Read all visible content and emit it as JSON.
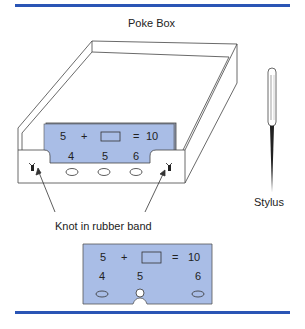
{
  "title": "Poke Box",
  "labels": {
    "stylus": "Stylus",
    "knot": "Knot in rubber band"
  },
  "box_card": {
    "equation": {
      "left": "5",
      "op": "+",
      "eq": "=",
      "result": "10"
    },
    "choices": [
      "4",
      "5",
      "6"
    ]
  },
  "detail_card": {
    "equation": {
      "left": "5",
      "op": "+",
      "eq": "=",
      "result": "10"
    },
    "choices": [
      "4",
      "5",
      "6"
    ]
  },
  "colors": {
    "rule": "#2a55b5",
    "card_fill": "#a9bde6",
    "card_edge": "#555555"
  }
}
